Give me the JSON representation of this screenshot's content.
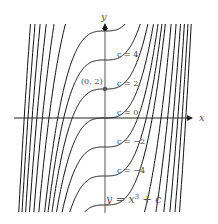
{
  "diagram": {
    "axes": {
      "x_label": "x",
      "y_label": "y"
    },
    "equation_label": "y = x",
    "equation_exponent": "3",
    "equation_suffix": " + c",
    "point_label": "(0, 2)",
    "highlight_point": {
      "x": 0,
      "y": 2
    },
    "c_labels": [
      {
        "text": "c = 4",
        "c": 4
      },
      {
        "text": "c = 2",
        "c": 2
      },
      {
        "text": "c = 0",
        "c": 0
      },
      {
        "text": "c = −2",
        "c": -2
      },
      {
        "text": "c = −4",
        "c": -4
      }
    ],
    "curve_c_values": [
      -30,
      -26,
      -22,
      -18,
      -14,
      -10,
      -6,
      -4,
      -2,
      0,
      2,
      4,
      6,
      10,
      14,
      18,
      22,
      26,
      30
    ],
    "colors": {
      "curve": "#111111",
      "axis": "#222222",
      "label": "#555555",
      "point": "#555555"
    }
  }
}
